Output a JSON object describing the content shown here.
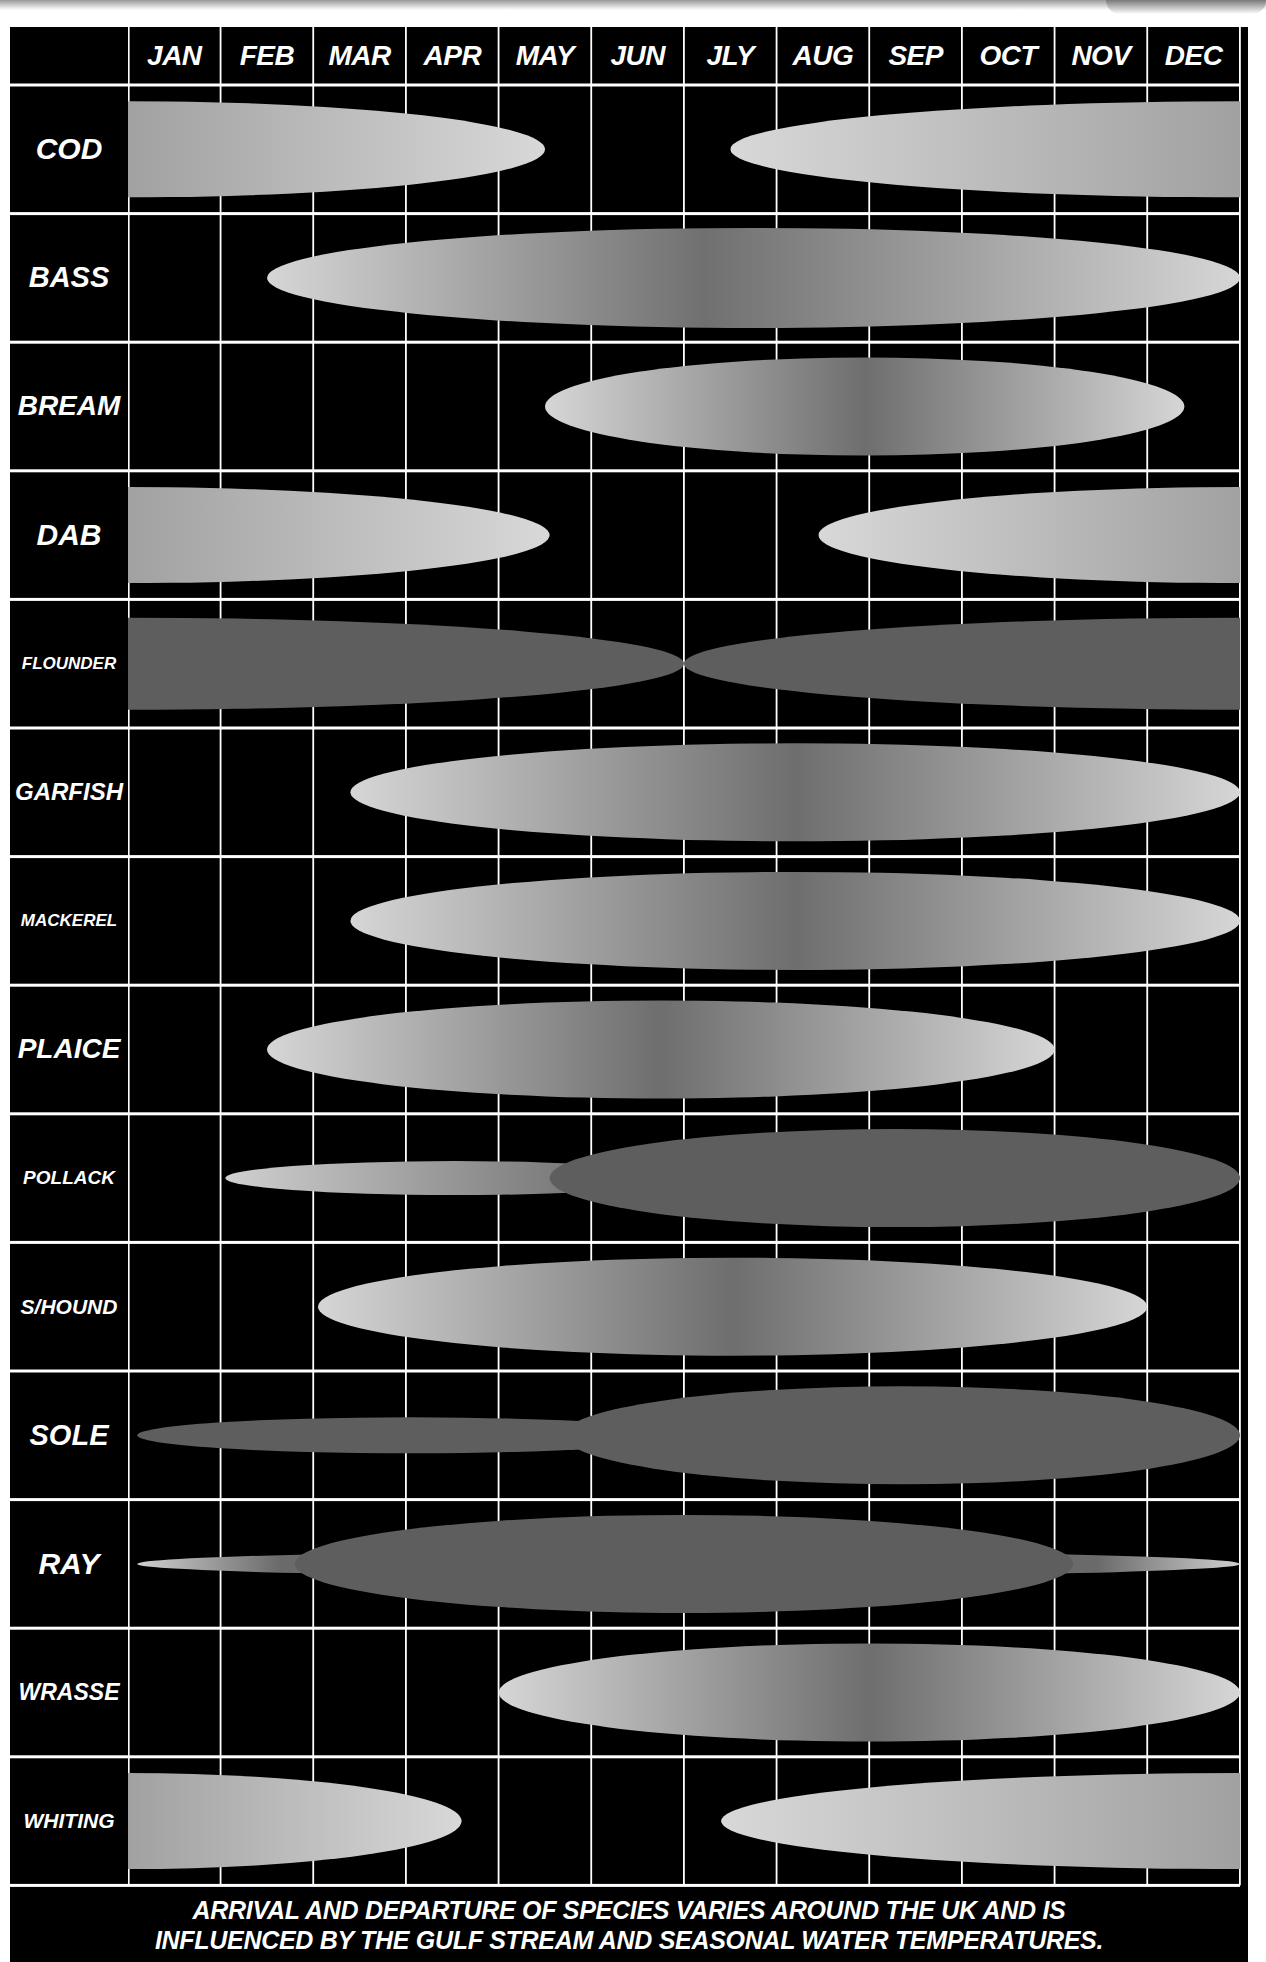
{
  "chart_data": {
    "type": "table",
    "title": "",
    "xlabel": "Month",
    "ylabel": "Species",
    "categories": [
      "JAN",
      "FEB",
      "MAR",
      "APR",
      "MAY",
      "JUN",
      "JLY",
      "AUG",
      "SEP",
      "OCT",
      "NOV",
      "DEC"
    ],
    "grid": true,
    "legend": "none",
    "note": "Each bar shows the months a species is present; shading indicates seasonal abundance (lighter/wider = more), darker solid fill indicates different phase.",
    "series": [
      {
        "name": "COD",
        "segments": [
          {
            "start": 0.0,
            "end": 4.5,
            "shape": "half-right"
          },
          {
            "start": 6.5,
            "end": 12.0,
            "shape": "half-left"
          }
        ]
      },
      {
        "name": "BASS",
        "segments": [
          {
            "start": 1.5,
            "end": 12.0,
            "shape": "ellipse"
          }
        ]
      },
      {
        "name": "BREAM",
        "segments": [
          {
            "start": 4.5,
            "end": 11.4,
            "shape": "ellipse"
          }
        ]
      },
      {
        "name": "DAB",
        "segments": [
          {
            "start": 0.0,
            "end": 4.55,
            "shape": "half-right"
          },
          {
            "start": 7.45,
            "end": 12.0,
            "shape": "half-left"
          }
        ]
      },
      {
        "name": "FLOUNDER",
        "segments": [
          {
            "start": 0.0,
            "end": 6.0,
            "shape": "half-right"
          },
          {
            "start": 6.0,
            "end": 12.0,
            "shape": "half-left"
          }
        ]
      },
      {
        "name": "GARFISH",
        "segments": [
          {
            "start": 2.4,
            "end": 12.0,
            "shape": "ellipse"
          }
        ]
      },
      {
        "name": "MACKEREL",
        "segments": [
          {
            "start": 2.4,
            "end": 12.0,
            "shape": "ellipse"
          }
        ]
      },
      {
        "name": "PLAICE",
        "segments": [
          {
            "start": 1.5,
            "end": 10.0,
            "shape": "ellipse"
          }
        ]
      },
      {
        "name": "POLLACK",
        "segments": [
          {
            "start": 1.05,
            "end": 6.0,
            "shape": "thin-ellipse"
          },
          {
            "start": 4.55,
            "end": 12.0,
            "shape": "ellipse"
          }
        ]
      },
      {
        "name": "S/HOUND",
        "segments": [
          {
            "start": 2.05,
            "end": 11.0,
            "shape": "ellipse"
          }
        ]
      },
      {
        "name": "SOLE",
        "segments": [
          {
            "start": 0.1,
            "end": 6.0,
            "shape": "thin-ellipse"
          },
          {
            "start": 4.7,
            "end": 12.0,
            "shape": "ellipse"
          }
        ]
      },
      {
        "name": "RAY",
        "segments": [
          {
            "start": 0.1,
            "end": 12.0,
            "shape": "thin-ellipse"
          },
          {
            "start": 1.8,
            "end": 10.2,
            "shape": "ellipse"
          }
        ]
      },
      {
        "name": "WRASSE",
        "segments": [
          {
            "start": 4.0,
            "end": 12.0,
            "shape": "ellipse"
          }
        ]
      },
      {
        "name": "WHITING",
        "segments": [
          {
            "start": 0.0,
            "end": 3.6,
            "shape": "half-right"
          },
          {
            "start": 6.4,
            "end": 12.0,
            "shape": "half-left"
          }
        ]
      }
    ]
  },
  "header": {
    "months": [
      "JAN",
      "FEB",
      "MAR",
      "APR",
      "MAY",
      "JUN",
      "JLY",
      "AUG",
      "SEP",
      "OCT",
      "NOV",
      "DEC"
    ]
  },
  "species": [
    {
      "label": "COD",
      "size": 30
    },
    {
      "label": "BASS",
      "size": 29
    },
    {
      "label": "BREAM",
      "size": 28
    },
    {
      "label": "DAB",
      "size": 30
    },
    {
      "label": "FLOUNDER",
      "size": 17
    },
    {
      "label": "GARFISH",
      "size": 24
    },
    {
      "label": "MACKEREL",
      "size": 17
    },
    {
      "label": "PLAICE",
      "size": 28
    },
    {
      "label": "POLLACK",
      "size": 19
    },
    {
      "label": "S/HOUND",
      "size": 21
    },
    {
      "label": "SOLE",
      "size": 29
    },
    {
      "label": "RAY",
      "size": 30
    },
    {
      "label": "WRASSE",
      "size": 23
    },
    {
      "label": "WHITING",
      "size": 21
    }
  ],
  "footer": {
    "line1": "ARRIVAL AND DEPARTURE OF SPECIES VARIES AROUND THE UK AND IS",
    "line2": "INFLUENCED BY THE GULF STREAM AND SEASONAL WATER TEMPERATURES."
  },
  "colors": {
    "background": "#000000",
    "grid": "#ffffff",
    "light_fill": "#d4d4d4",
    "dark_fill": "#5e5e5e",
    "text": "#ffffff"
  }
}
